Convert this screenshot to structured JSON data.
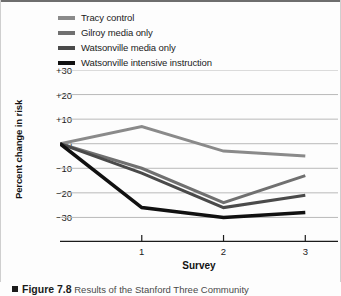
{
  "figure": {
    "caption_marker": "square-bullet",
    "figure_number": "Figure 7.8",
    "caption_text": "Results of the Stanford Three Community"
  },
  "legend": {
    "position": "top-left",
    "items": [
      {
        "label": "Tracy control",
        "color": "#8a8a8a"
      },
      {
        "label": "Gilroy media only",
        "color": "#707070"
      },
      {
        "label": "Watsonville media only",
        "color": "#4a4a4a"
      },
      {
        "label": "Watsonville intensive instruction",
        "color": "#111111"
      }
    ]
  },
  "axes": {
    "ylabel": "Percent change in risk",
    "xlabel": "Survey",
    "yticks": [
      "+30",
      "+20",
      "+10",
      "0",
      "−10",
      "−20",
      "−30"
    ],
    "xticks": [
      "1",
      "2",
      "3"
    ]
  },
  "chart_data": {
    "type": "line",
    "title": "",
    "xlabel": "Survey",
    "ylabel": "Percent change in risk",
    "x": [
      0,
      1,
      2,
      3
    ],
    "xticklabels": [
      "",
      "1",
      "2",
      "3"
    ],
    "xlim": [
      0,
      3.4
    ],
    "ylim": [
      -40,
      30
    ],
    "yticks": [
      30,
      20,
      10,
      0,
      -10,
      -20,
      -30
    ],
    "yticklabels": [
      "+30",
      "+20",
      "+10",
      "0",
      "−10",
      "−20",
      "−30"
    ],
    "grid": true,
    "grid_axis": "y",
    "legend_position": "top-left",
    "series": [
      {
        "name": "Tracy control",
        "color": "#8a8a8a",
        "width": 3.0,
        "values": [
          0,
          7,
          -3,
          -5
        ]
      },
      {
        "name": "Gilroy media only",
        "color": "#707070",
        "width": 3.0,
        "values": [
          0,
          -10,
          -24,
          -13
        ]
      },
      {
        "name": "Watsonville media only",
        "color": "#4a4a4a",
        "width": 3.0,
        "values": [
          0,
          -12,
          -26,
          -21
        ]
      },
      {
        "name": "Watsonville intensive instruction",
        "color": "#111111",
        "width": 3.6,
        "values": [
          0,
          -26,
          -30,
          -28
        ]
      }
    ]
  }
}
